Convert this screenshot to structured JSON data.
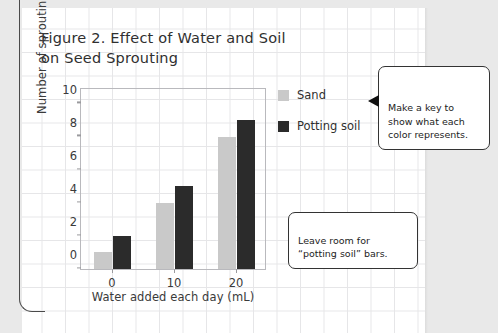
{
  "figure": {
    "title": "Figure 2. Effect of Water and\nSoil on Seed Sprouting"
  },
  "chart_data": {
    "type": "bar",
    "title": "Figure 2. Effect of Water and Soil on Seed Sprouting",
    "xlabel": "Water added each day (mL)",
    "ylabel": "Number of sprouting seeds",
    "categories": [
      "0",
      "10",
      "20"
    ],
    "yticks": [
      "0",
      "2",
      "4",
      "6",
      "8",
      "10"
    ],
    "ylim": [
      0,
      11
    ],
    "grid": false,
    "legend_position": "right",
    "series": [
      {
        "name": "Sand",
        "color": "#c9c9c9",
        "values": [
          1,
          4,
          8
        ]
      },
      {
        "name": "Potting soil",
        "color": "#2b2b2b",
        "values": [
          2,
          5,
          9
        ]
      }
    ]
  },
  "legend": {
    "items": [
      {
        "label": "Sand",
        "color": "#c9c9c9"
      },
      {
        "label": "Potting soil",
        "color": "#2b2b2b"
      }
    ]
  },
  "callouts": [
    {
      "text": "Make a key to show what each color represents."
    },
    {
      "text": "Leave room for “potting soil” bars."
    }
  ]
}
